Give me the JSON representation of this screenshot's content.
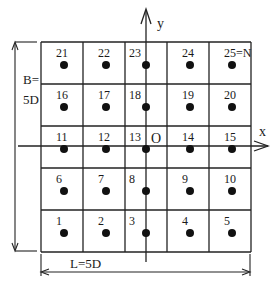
{
  "diagram": {
    "grid": {
      "rows": 5,
      "cols": 5,
      "left": 41,
      "top": 42,
      "cell": 42
    },
    "cells": [
      {
        "label": "21",
        "row": 0,
        "col": 0
      },
      {
        "label": "22",
        "row": 0,
        "col": 1
      },
      {
        "label": "23",
        "row": 0,
        "col": 2
      },
      {
        "label": "24",
        "row": 0,
        "col": 3
      },
      {
        "label": "25=N",
        "row": 0,
        "col": 4
      },
      {
        "label": "16",
        "row": 1,
        "col": 0
      },
      {
        "label": "17",
        "row": 1,
        "col": 1
      },
      {
        "label": "18",
        "row": 1,
        "col": 2
      },
      {
        "label": "19",
        "row": 1,
        "col": 3
      },
      {
        "label": "20",
        "row": 1,
        "col": 4
      },
      {
        "label": "11",
        "row": 2,
        "col": 0
      },
      {
        "label": "12",
        "row": 2,
        "col": 1
      },
      {
        "label": "13",
        "row": 2,
        "col": 2
      },
      {
        "label": "14",
        "row": 2,
        "col": 3
      },
      {
        "label": "15",
        "row": 2,
        "col": 4
      },
      {
        "label": "6",
        "row": 3,
        "col": 0
      },
      {
        "label": "7",
        "row": 3,
        "col": 1
      },
      {
        "label": "8",
        "row": 3,
        "col": 2
      },
      {
        "label": "9",
        "row": 3,
        "col": 3
      },
      {
        "label": "10",
        "row": 3,
        "col": 4
      },
      {
        "label": "1",
        "row": 4,
        "col": 0
      },
      {
        "label": "2",
        "row": 4,
        "col": 1
      },
      {
        "label": "3",
        "row": 4,
        "col": 2
      },
      {
        "label": "4",
        "row": 4,
        "col": 3
      },
      {
        "label": "5",
        "row": 4,
        "col": 4
      }
    ],
    "axes": {
      "x_label": "x",
      "y_label": "y",
      "origin_label": "O"
    },
    "dimensions": {
      "height_label_line1": "B=",
      "height_label_line2": "5D",
      "width_label": "L=5D"
    },
    "colors": {
      "line": "#222222",
      "dot": "#111111"
    }
  }
}
